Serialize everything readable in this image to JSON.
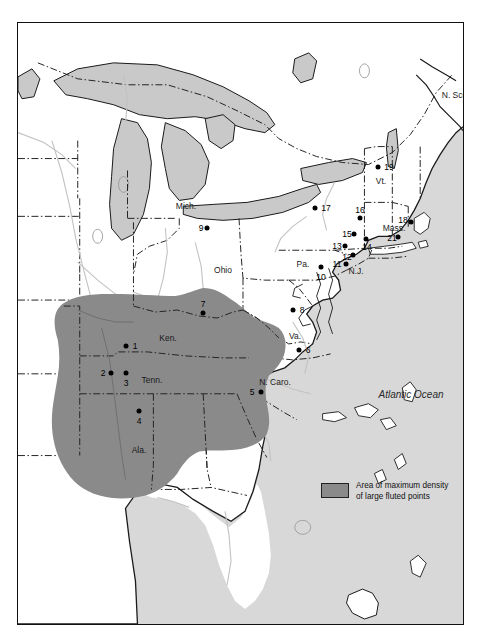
{
  "figure": {
    "kind": "thematic-map",
    "region": "Eastern North America",
    "ocean_label": "Atlantic Ocean"
  },
  "legend": {
    "swatch_color": "#8a8a8a",
    "line1": "Area of maximum density",
    "line2": "of large fluted points"
  },
  "colors": {
    "land": "#ffffff",
    "ocean": "#d8d8d8",
    "lake": "#c9c9c9",
    "density_area": "#8a8a8a",
    "coastline": "#1a1a1a",
    "state_border": "#1a1a1a",
    "river": "#c0c0c0"
  },
  "place_labels": [
    {
      "name": "Mich.",
      "text": "Mich.",
      "x": 168,
      "y": 183
    },
    {
      "name": "Ohio",
      "text": "Ohio",
      "x": 205,
      "y": 247
    },
    {
      "name": "Pa.",
      "text": "Pa.",
      "x": 285,
      "y": 241
    },
    {
      "name": "N.J.",
      "text": "N.J.",
      "x": 338,
      "y": 248
    },
    {
      "name": "Vt.",
      "text": "Vt.",
      "x": 363,
      "y": 158
    },
    {
      "name": "Mass.",
      "text": "Mass.",
      "x": 376,
      "y": 205
    },
    {
      "name": "Ken.",
      "text": "Ken.",
      "x": 150,
      "y": 315
    },
    {
      "name": "Tenn.",
      "text": "Tenn.",
      "x": 134,
      "y": 357
    },
    {
      "name": "Ala.",
      "text": "Ala.",
      "x": 121,
      "y": 427
    },
    {
      "name": "Va.",
      "text": "Va.",
      "x": 277,
      "y": 313
    },
    {
      "name": "N. Caro.",
      "text": "N. Caro.",
      "x": 257,
      "y": 359
    },
    {
      "name": "N. Scotia",
      "text": "N. Scotia",
      "x": 441,
      "y": 72
    },
    {
      "name": "Atlantic Ocean",
      "text": "Atlantic Ocean",
      "x": 393,
      "y": 371,
      "style": "ocean"
    }
  ],
  "site_points": [
    {
      "id": "1",
      "label": "1",
      "px": 108,
      "py": 323,
      "lx": 117,
      "ly": 323
    },
    {
      "id": "2",
      "label": "2",
      "px": 93,
      "py": 350,
      "lx": 85,
      "ly": 350
    },
    {
      "id": "3",
      "label": "3",
      "px": 108,
      "py": 350,
      "lx": 108,
      "ly": 360
    },
    {
      "id": "4",
      "label": "4",
      "px": 121,
      "py": 388,
      "lx": 121,
      "ly": 398
    },
    {
      "id": "5",
      "label": "5",
      "px": 243,
      "py": 369,
      "lx": 234,
      "ly": 369
    },
    {
      "id": "6",
      "label": "6",
      "px": 281,
      "py": 327,
      "lx": 290,
      "ly": 327
    },
    {
      "id": "7",
      "label": "7",
      "px": 185,
      "py": 290,
      "lx": 185,
      "ly": 282
    },
    {
      "id": "8",
      "label": "8",
      "px": 275,
      "py": 287,
      "lx": 284,
      "ly": 287
    },
    {
      "id": "9",
      "label": "9",
      "px": 189,
      "py": 205,
      "lx": 183,
      "ly": 205
    },
    {
      "id": "10",
      "label": "10",
      "px": 303,
      "py": 244,
      "lx": 303,
      "ly": 253
    },
    {
      "id": "11",
      "label": "11",
      "px": 328,
      "py": 241,
      "lx": 320,
      "ly": 241
    },
    {
      "id": "12",
      "label": "12",
      "px": 335,
      "py": 232,
      "lx": 330,
      "ly": 234
    },
    {
      "id": "13",
      "label": "13",
      "px": 327,
      "py": 223,
      "lx": 320,
      "ly": 223
    },
    {
      "id": "14",
      "label": "14",
      "px": 348,
      "py": 216,
      "lx": 349,
      "ly": 223
    },
    {
      "id": "15",
      "label": "15",
      "px": 336,
      "py": 211,
      "lx": 330,
      "ly": 211
    },
    {
      "id": "16",
      "label": "16",
      "px": 342,
      "py": 195,
      "lx": 342,
      "ly": 188
    },
    {
      "id": "17",
      "label": "17",
      "px": 297,
      "py": 185,
      "lx": 308,
      "ly": 185
    },
    {
      "id": "18",
      "label": "18",
      "px": 393,
      "py": 199,
      "lx": 386,
      "ly": 197
    },
    {
      "id": "19",
      "label": "19",
      "px": 360,
      "py": 144,
      "lx": 370,
      "ly": 144
    },
    {
      "id": "20",
      "label": "20",
      "px": 460,
      "py": 97,
      "lx": 454,
      "ly": 97
    },
    {
      "id": "21",
      "label": "21",
      "px": 379,
      "py": 214,
      "lx": 374,
      "ly": 215
    }
  ]
}
